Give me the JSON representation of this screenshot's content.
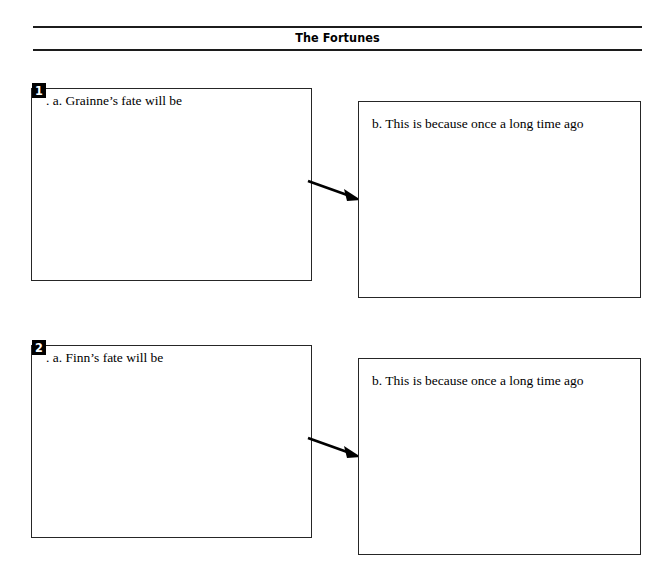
{
  "page": {
    "title": "The Fortunes"
  },
  "exercises": [
    {
      "number": "1",
      "left_prompt": ". a. Grainne’s fate will be",
      "right_prompt": "b. This is because once a long time ago",
      "arrow": "arrow-right-down"
    },
    {
      "number": "2",
      "left_prompt": ". a. Finn’s fate will be",
      "right_prompt": "b. This is because once a long time ago",
      "arrow": "arrow-right-down"
    }
  ],
  "colors": {
    "ink": "#000000",
    "rule": "#1c1c1c",
    "box_border": "#262626",
    "page_background": "#ffffff",
    "badge_background": "#000000",
    "badge_text": "#ffffff"
  }
}
